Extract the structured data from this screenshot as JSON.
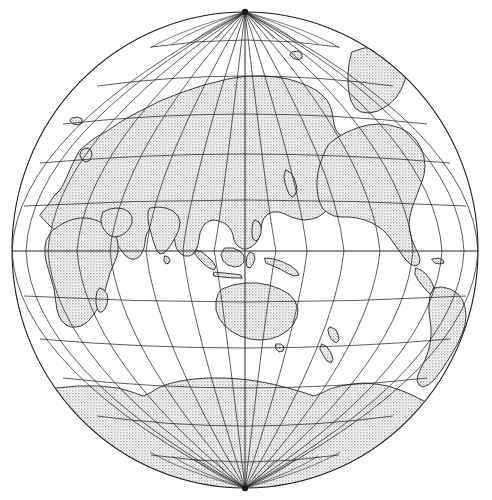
{
  "document": {
    "type": "map-figure",
    "title": "World map on a globular projection",
    "background_color": "#ffffff",
    "width": 492,
    "height": 500
  },
  "map": {
    "name": "world-globe",
    "projection": "globular (Van der Grinten style) hemispheric globe",
    "center_latitude": 0,
    "center_longitude": 125,
    "center_label": "0°N, 125°E",
    "outline_color": "#1a1a1a",
    "land_fill_color": "#d9d9d9",
    "ocean_fill_color": "#ffffff",
    "graticule_color": "#262626",
    "limb": {
      "center_x": 245,
      "center_y": 250,
      "radius_x": 233,
      "radius_y": 238,
      "stroke_width": 1.1
    },
    "graticule": {
      "parallel_interval_degrees": 15,
      "meridian_interval_degrees": 15,
      "parallels": [
        75,
        60,
        45,
        30,
        15,
        0,
        -15,
        -30,
        -45,
        -60,
        -75
      ],
      "meridians": [
        5,
        20,
        35,
        50,
        65,
        80,
        95,
        110,
        125,
        140,
        155,
        170,
        185,
        200,
        215,
        230,
        245
      ],
      "equator_latitude": 0,
      "central_meridian_longitude": 125,
      "pole_north_label": "North Pole",
      "pole_south_label": "South Pole",
      "line_width": 0.75,
      "visible": true
    },
    "landmasses": [
      {
        "name": "Africa",
        "region": "west-left-limb"
      },
      {
        "name": "Europe",
        "region": "upper-left"
      },
      {
        "name": "Asia",
        "region": "upper-center"
      },
      {
        "name": "Arabian Peninsula",
        "region": "left-center"
      },
      {
        "name": "India",
        "region": "left-center"
      },
      {
        "name": "Indonesia",
        "region": "center"
      },
      {
        "name": "Australia",
        "region": "lower-center"
      },
      {
        "name": "New Zealand",
        "region": "lower-center-right"
      },
      {
        "name": "Japan",
        "region": "upper-center-right"
      },
      {
        "name": "Siberia",
        "region": "upper-center"
      },
      {
        "name": "Greenland",
        "region": "upper-right-limb"
      },
      {
        "name": "North America",
        "region": "right"
      },
      {
        "name": "Central America",
        "region": "right"
      },
      {
        "name": "South America",
        "region": "lower-right-limb"
      },
      {
        "name": "Antarctica",
        "region": "bottom"
      },
      {
        "name": "Madagascar",
        "region": "lower-left"
      },
      {
        "name": "Iceland",
        "region": "upper-left-limb"
      },
      {
        "name": "British Isles",
        "region": "upper-left"
      },
      {
        "name": "Philippines",
        "region": "center"
      },
      {
        "name": "New Guinea",
        "region": "center"
      },
      {
        "name": "Sri Lanka",
        "region": "left-center"
      },
      {
        "name": "Borneo",
        "region": "center"
      },
      {
        "name": "Sumatra",
        "region": "center-left"
      },
      {
        "name": "Svalbard",
        "region": "top"
      }
    ]
  }
}
